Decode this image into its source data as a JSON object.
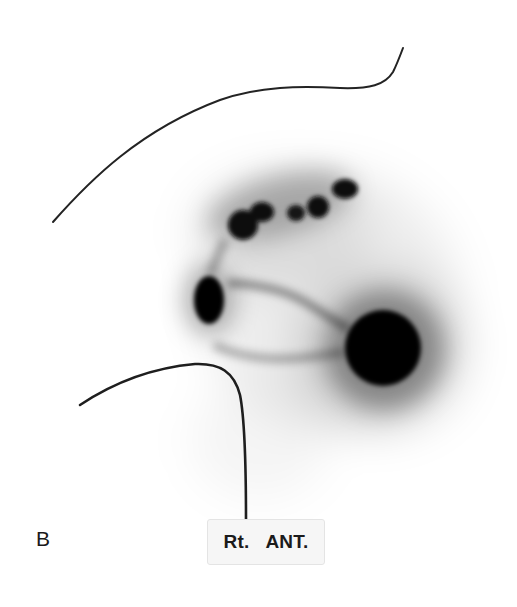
{
  "figure": {
    "panel_letter": "B",
    "view_label": {
      "side": "Rt.",
      "projection": "ANT."
    }
  },
  "colors": {
    "background": "#ffffff",
    "uptake": "#0a0a0a",
    "outline": "#222222"
  }
}
